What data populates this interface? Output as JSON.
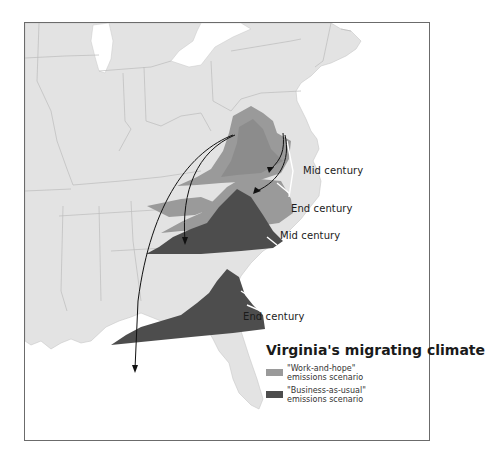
{
  "map": {
    "title": "Virginia's migrating climate",
    "colors": {
      "land": "#e3e3e3",
      "water": "#ffffff",
      "borders": "#bdbdbd",
      "work_and_hope": "#9a9a9a",
      "business_as_usual": "#4d4d4d",
      "arrows": "#111111",
      "frame": "#6b6b6b"
    },
    "labels": {
      "wh_mid": "Mid century",
      "wh_end": "End century",
      "bau_mid": "Mid century",
      "bau_end": "End century"
    },
    "legend": {
      "items": [
        {
          "line1": "\"Work-and-hope\"",
          "line2": "emissions scenario",
          "color": "#9a9a9a"
        },
        {
          "line1": "\"Business-as-usual\"",
          "line2": "emissions scenario",
          "color": "#4d4d4d"
        }
      ]
    }
  }
}
